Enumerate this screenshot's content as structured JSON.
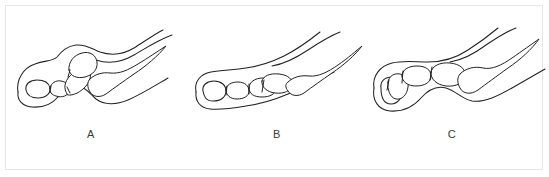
{
  "figure": {
    "type": "anatomical-line-diagram",
    "background_color": "#ffffff",
    "frame_color": "#e6e6e6",
    "line_color": "#222222",
    "label_color": "#3a3a3a",
    "panel_count": 3
  },
  "panels": [
    {
      "id": "panel-a",
      "label": "A",
      "description": "toe profile with raised proximal phalanx and flexed distal segment"
    },
    {
      "id": "panel-b",
      "label": "B",
      "description": "flatter horizontal toe profile with aligned phalanges"
    },
    {
      "id": "panel-c",
      "label": "C",
      "description": "toe profile with downward angled distal phalanx"
    }
  ],
  "labels": {
    "a": "A",
    "b": "B",
    "c": "C"
  }
}
